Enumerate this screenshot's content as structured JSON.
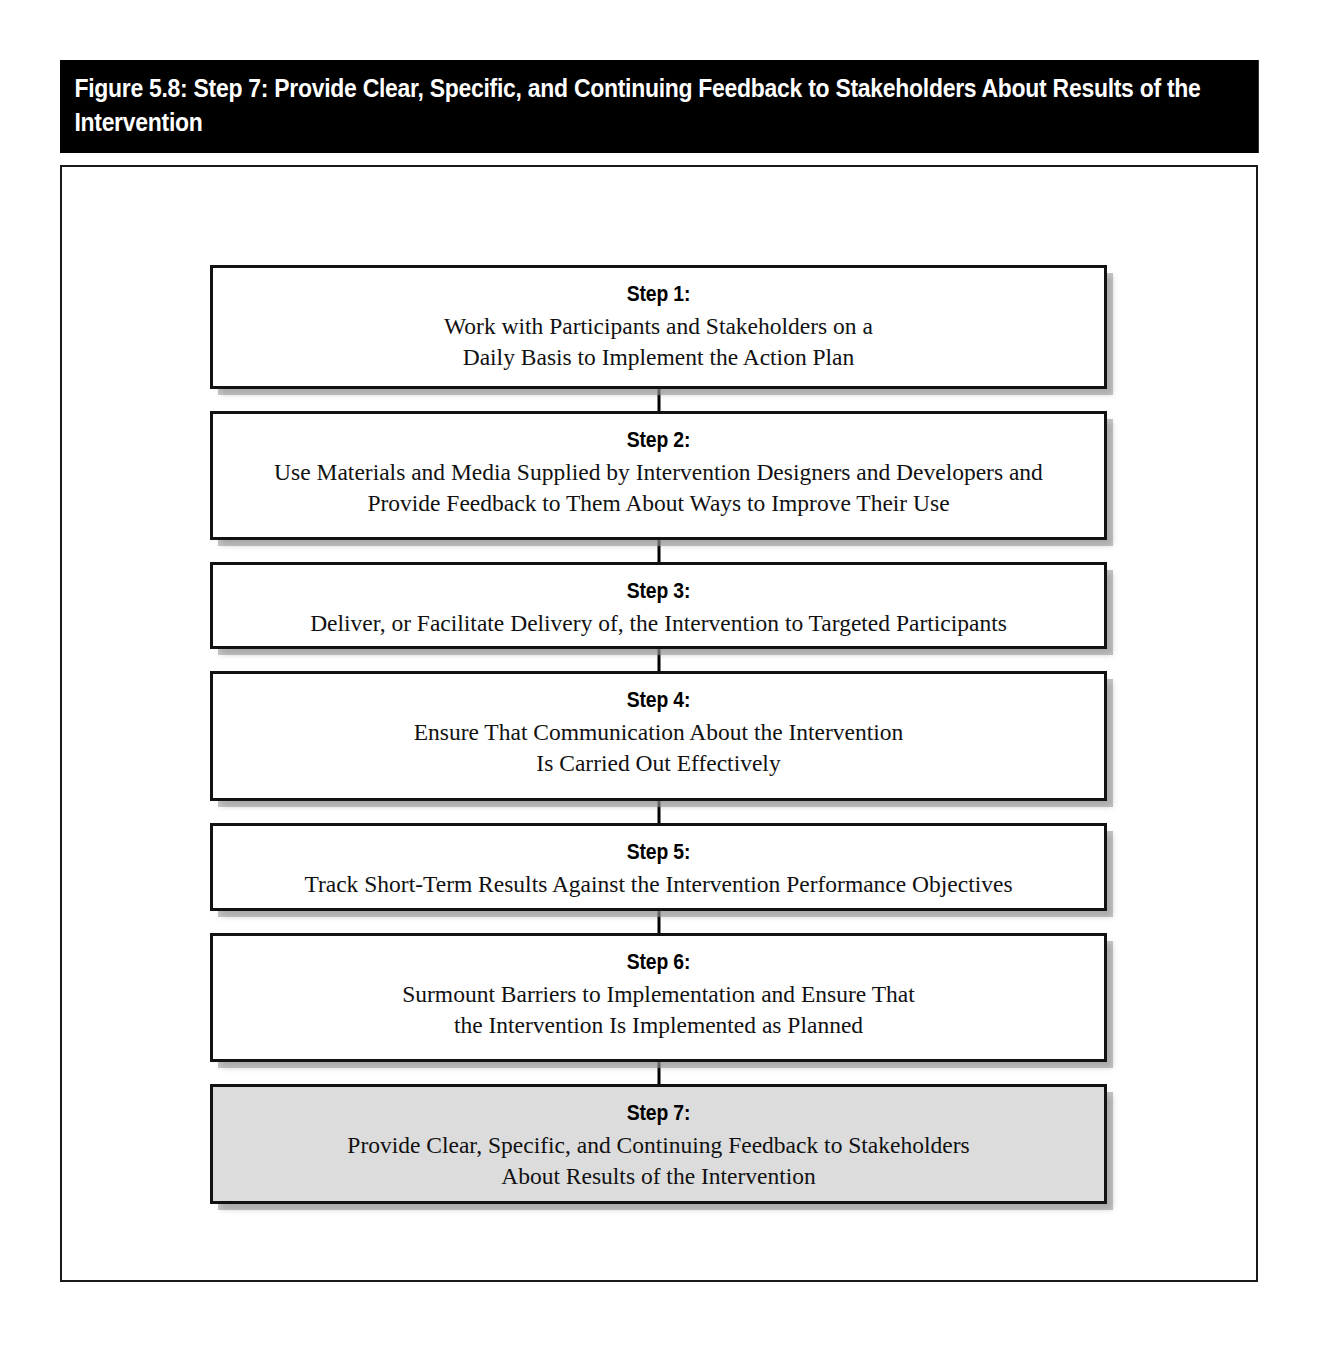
{
  "figure": {
    "title": "Figure 5.8: Step 7: Provide Clear, Specific, and Continuing Feedback to Stakeholders About Results of the Intervention",
    "accent_color": "#000000",
    "highlight_fill": "#dcdcdc",
    "box_border_color": "#121212"
  },
  "flow": {
    "type": "vertical-sequence",
    "steps": [
      {
        "label": "Step 1:",
        "text": "Work with Participants and Stakeholders on a\nDaily Basis to Implement the Action Plan",
        "highlighted": false,
        "height": 124
      },
      {
        "label": "Step 2:",
        "text": "Use Materials and Media Supplied by Intervention Designers and Developers and\nProvide Feedback to Them About Ways to Improve Their Use",
        "highlighted": false,
        "height": 129
      },
      {
        "label": "Step 3:",
        "text": "Deliver, or Facilitate Delivery of, the Intervention to Targeted Participants",
        "highlighted": false,
        "height": 87
      },
      {
        "label": "Step 4:",
        "text": "Ensure That Communication About the Intervention\nIs Carried Out Effectively",
        "highlighted": false,
        "height": 130
      },
      {
        "label": "Step 5:",
        "text": "Track Short-Term Results Against the Intervention Performance Objectives",
        "highlighted": false,
        "height": 88
      },
      {
        "label": "Step 6:",
        "text": "Surmount Barriers to Implementation and Ensure That\nthe Intervention Is Implemented as Planned",
        "highlighted": false,
        "height": 129
      },
      {
        "label": "Step 7:",
        "text": "Provide Clear, Specific, and Continuing Feedback to Stakeholders\nAbout Results of the Intervention",
        "highlighted": true,
        "height": 120
      }
    ]
  }
}
